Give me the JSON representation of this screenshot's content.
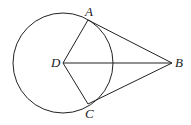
{
  "diagram": {
    "circle": {
      "cx": 63,
      "cy": 63,
      "r": 50,
      "center_label": "D"
    },
    "points": [
      {
        "label": "A",
        "x": 88,
        "y": 20,
        "lx": 85,
        "ly": 5
      },
      {
        "label": "B",
        "x": 172,
        "y": 63,
        "lx": 175,
        "ly": 56
      },
      {
        "label": "C",
        "x": 88,
        "y": 104,
        "lx": 85,
        "ly": 107
      },
      {
        "label": "D",
        "x": 63,
        "y": 63,
        "lx": 51,
        "ly": 56
      }
    ],
    "segments": [
      [
        "D",
        "A"
      ],
      [
        "D",
        "C"
      ],
      [
        "D",
        "B"
      ],
      [
        "A",
        "B"
      ],
      [
        "C",
        "B"
      ]
    ],
    "stroke": "#222222"
  }
}
